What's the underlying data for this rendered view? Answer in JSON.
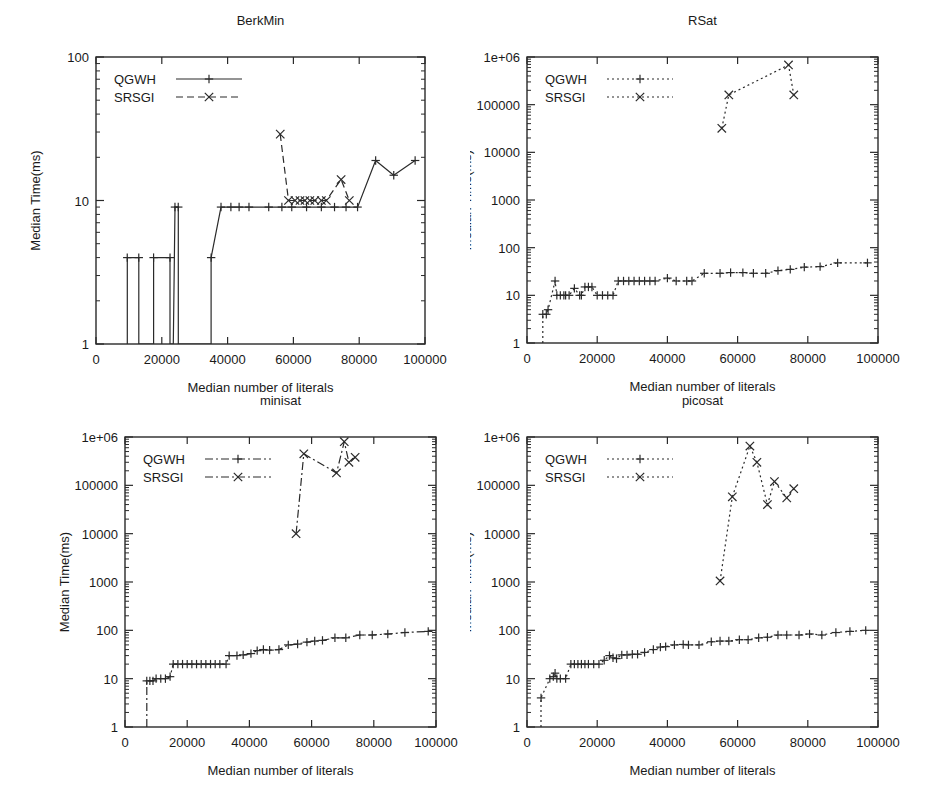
{
  "figure": {
    "xlabel": "Median number of literals",
    "ylabel": "Median  Time(ms)",
    "legend": {
      "series1": "QGWH",
      "series2": "SRSGI"
    },
    "colors": {
      "ink": "#2a2a2a",
      "background": "#ffffff"
    }
  },
  "chart_data": [
    {
      "id": "berkmin",
      "type": "line",
      "title": "BerkMin",
      "xlabel": "Median number of literals",
      "ylabel": "Median  Time(ms)",
      "xlim": [
        0,
        100000
      ],
      "ylim": [
        1,
        100
      ],
      "yscale": "log",
      "grid": false,
      "legend_position": "top-left",
      "xticks": [
        0,
        20000,
        40000,
        60000,
        80000,
        100000
      ],
      "xticklabels": [
        "0",
        "20000",
        "40000",
        "60000",
        "80000",
        "100000"
      ],
      "yticks": [
        1,
        10,
        100
      ],
      "yticklabels": [
        "1",
        "10",
        "100"
      ],
      "series": [
        {
          "name": "QGWH",
          "style": "solid",
          "marker": "plus",
          "points": [
            [
              9500,
              1
            ],
            [
              9500,
              4
            ],
            [
              13000,
              4
            ],
            [
              13000,
              1
            ],
            [
              17500,
              1
            ],
            [
              17500,
              4
            ],
            [
              22500,
              4
            ],
            [
              22500,
              1
            ],
            [
              23500,
              1
            ],
            [
              24000,
              9
            ],
            [
              25000,
              9
            ],
            [
              25000,
              1
            ],
            [
              35000,
              1
            ],
            [
              35000,
              4
            ],
            [
              38000,
              9
            ],
            [
              41000,
              9
            ],
            [
              43500,
              9
            ],
            [
              46500,
              9
            ],
            [
              52500,
              9
            ],
            [
              56500,
              9
            ],
            [
              59500,
              9
            ],
            [
              64000,
              9
            ],
            [
              68500,
              9
            ],
            [
              72500,
              9
            ],
            [
              76000,
              9
            ],
            [
              79500,
              9
            ],
            [
              85000,
              19
            ],
            [
              90500,
              15
            ],
            [
              97000,
              19
            ]
          ]
        },
        {
          "name": "SRSGI",
          "style": "dashed",
          "marker": "cross",
          "points": [
            [
              56000,
              29
            ],
            [
              58500,
              10
            ],
            [
              60500,
              10
            ],
            [
              62000,
              10
            ],
            [
              63500,
              10
            ],
            [
              65000,
              10
            ],
            [
              66500,
              10
            ],
            [
              68500,
              10
            ],
            [
              70000,
              10
            ],
            [
              74500,
              14
            ],
            [
              77000,
              10
            ]
          ]
        }
      ]
    },
    {
      "id": "rsat",
      "type": "line",
      "title": "RSat",
      "xlabel": "Median number of literals",
      "ylabel": "Median  Time(ms)",
      "xlim": [
        0,
        100000
      ],
      "ylim": [
        1,
        1000000
      ],
      "yscale": "log",
      "grid": false,
      "legend_position": "top-left",
      "xticks": [
        0,
        20000,
        40000,
        60000,
        80000,
        100000
      ],
      "xticklabels": [
        "0",
        "20000",
        "40000",
        "60000",
        "80000",
        "100000"
      ],
      "yticks": [
        1,
        10,
        100,
        1000,
        10000,
        100000,
        1000000
      ],
      "yticklabels": [
        "1",
        "10",
        "100",
        "1000",
        "10000",
        "100000",
        "1e+06"
      ],
      "series": [
        {
          "name": "QGWH",
          "style": "dotted",
          "marker": "plus",
          "points": [
            [
              4500,
              1
            ],
            [
              4500,
              4
            ],
            [
              5500,
              4
            ],
            [
              6000,
              5
            ],
            [
              8000,
              20
            ],
            [
              8500,
              10
            ],
            [
              9500,
              10
            ],
            [
              10500,
              10
            ],
            [
              11000,
              10
            ],
            [
              12000,
              10
            ],
            [
              13500,
              14
            ],
            [
              15000,
              10
            ],
            [
              15500,
              10
            ],
            [
              16500,
              15
            ],
            [
              17500,
              15
            ],
            [
              18500,
              15
            ],
            [
              20000,
              10
            ],
            [
              21500,
              10
            ],
            [
              23000,
              10
            ],
            [
              24500,
              10
            ],
            [
              26000,
              20
            ],
            [
              27500,
              20
            ],
            [
              29000,
              20
            ],
            [
              30500,
              20
            ],
            [
              32000,
              20
            ],
            [
              33500,
              20
            ],
            [
              35000,
              20
            ],
            [
              36500,
              20
            ],
            [
              40000,
              23
            ],
            [
              42500,
              20
            ],
            [
              45500,
              20
            ],
            [
              47000,
              20
            ],
            [
              50500,
              29
            ],
            [
              55000,
              29
            ],
            [
              58000,
              30
            ],
            [
              61500,
              30
            ],
            [
              64500,
              29
            ],
            [
              68000,
              29
            ],
            [
              71500,
              33
            ],
            [
              75000,
              35
            ],
            [
              79000,
              39
            ],
            [
              83500,
              40
            ],
            [
              88500,
              48
            ],
            [
              97000,
              48
            ]
          ]
        },
        {
          "name": "SRSGI",
          "style": "dotted",
          "marker": "cross",
          "points": [
            [
              55500,
              32000
            ],
            [
              57500,
              160000
            ],
            [
              74500,
              680000
            ],
            [
              76000,
              160000
            ]
          ]
        }
      ]
    },
    {
      "id": "minisat",
      "type": "line",
      "title": "minisat",
      "xlabel": "Median number of literals",
      "ylabel": "Median  Time(ms)",
      "xlim": [
        0,
        100000
      ],
      "ylim": [
        1,
        1000000
      ],
      "yscale": "log",
      "grid": false,
      "legend_position": "top-left",
      "xticks": [
        0,
        20000,
        40000,
        60000,
        80000,
        100000
      ],
      "xticklabels": [
        "0",
        "20000",
        "40000",
        "60000",
        "80000",
        "100000"
      ],
      "yticks": [
        1,
        10,
        100,
        1000,
        10000,
        100000,
        1000000
      ],
      "yticklabels": [
        "1",
        "10",
        "100",
        "1000",
        "10000",
        "100000",
        "1e+06"
      ],
      "series": [
        {
          "name": "QGWH",
          "style": "dashdot",
          "marker": "plus",
          "points": [
            [
              7000,
              1
            ],
            [
              7000,
              9
            ],
            [
              8000,
              9
            ],
            [
              9000,
              9
            ],
            [
              10000,
              10
            ],
            [
              11500,
              10
            ],
            [
              13000,
              10
            ],
            [
              14500,
              11
            ],
            [
              15500,
              20
            ],
            [
              17000,
              20
            ],
            [
              18500,
              20
            ],
            [
              20000,
              20
            ],
            [
              21500,
              20
            ],
            [
              23000,
              20
            ],
            [
              24500,
              20
            ],
            [
              26000,
              20
            ],
            [
              27500,
              20
            ],
            [
              29000,
              20
            ],
            [
              30500,
              20
            ],
            [
              32500,
              20
            ],
            [
              33500,
              30
            ],
            [
              36000,
              30
            ],
            [
              38000,
              31
            ],
            [
              40500,
              33
            ],
            [
              42500,
              38
            ],
            [
              44500,
              40
            ],
            [
              46500,
              39
            ],
            [
              49500,
              40
            ],
            [
              52500,
              50
            ],
            [
              55500,
              52
            ],
            [
              58500,
              57
            ],
            [
              61000,
              60
            ],
            [
              63500,
              62
            ],
            [
              67500,
              70
            ],
            [
              71000,
              70
            ],
            [
              75500,
              80
            ],
            [
              79500,
              80
            ],
            [
              84500,
              84
            ],
            [
              90000,
              90
            ],
            [
              97500,
              95
            ]
          ]
        },
        {
          "name": "SRSGI",
          "style": "dashdot",
          "marker": "cross",
          "points": [
            [
              55000,
              10000
            ],
            [
              57500,
              450000
            ],
            [
              68000,
              180000
            ],
            [
              70500,
              800000
            ],
            [
              72000,
              300000
            ],
            [
              74000,
              380000
            ]
          ]
        }
      ]
    },
    {
      "id": "picosat",
      "type": "line",
      "title": "picosat",
      "xlabel": "Median number of literals",
      "ylabel": "Median  Time(ms)",
      "xlim": [
        0,
        100000
      ],
      "ylim": [
        1,
        1000000
      ],
      "yscale": "log",
      "grid": false,
      "legend_position": "top-left",
      "xticks": [
        0,
        20000,
        40000,
        60000,
        80000,
        100000
      ],
      "xticklabels": [
        "0",
        "20000",
        "40000",
        "60000",
        "80000",
        "100000"
      ],
      "yticks": [
        1,
        10,
        100,
        1000,
        10000,
        100000,
        1000000
      ],
      "yticklabels": [
        "1",
        "10",
        "100",
        "1000",
        "10000",
        "100000",
        "1e+06"
      ],
      "series": [
        {
          "name": "QGWH",
          "style": "dotted",
          "marker": "plus",
          "points": [
            [
              4000,
              1
            ],
            [
              4000,
              4
            ],
            [
              6500,
              10
            ],
            [
              7500,
              11
            ],
            [
              8000,
              13
            ],
            [
              8500,
              10
            ],
            [
              9500,
              10
            ],
            [
              11000,
              10
            ],
            [
              12500,
              20
            ],
            [
              13500,
              20
            ],
            [
              14500,
              20
            ],
            [
              15500,
              20
            ],
            [
              16500,
              20
            ],
            [
              17500,
              20
            ],
            [
              19000,
              20
            ],
            [
              20500,
              20
            ],
            [
              22000,
              24
            ],
            [
              23500,
              30
            ],
            [
              24500,
              27
            ],
            [
              25500,
              26
            ],
            [
              27000,
              31
            ],
            [
              28500,
              31
            ],
            [
              30000,
              32
            ],
            [
              31500,
              32
            ],
            [
              33500,
              35
            ],
            [
              36000,
              40
            ],
            [
              38000,
              45
            ],
            [
              39500,
              46
            ],
            [
              42000,
              50
            ],
            [
              44500,
              51
            ],
            [
              46000,
              50
            ],
            [
              49000,
              50
            ],
            [
              52500,
              58
            ],
            [
              55000,
              60
            ],
            [
              57500,
              60
            ],
            [
              60500,
              64
            ],
            [
              63000,
              64
            ],
            [
              66000,
              70
            ],
            [
              68500,
              72
            ],
            [
              71500,
              80
            ],
            [
              74000,
              80
            ],
            [
              77500,
              80
            ],
            [
              80500,
              84
            ],
            [
              84000,
              80
            ],
            [
              88000,
              90
            ],
            [
              92000,
              95
            ],
            [
              96500,
              100
            ]
          ]
        },
        {
          "name": "SRSGI",
          "style": "dotted",
          "marker": "cross",
          "points": [
            [
              55000,
              1050
            ],
            [
              58500,
              58000
            ],
            [
              63500,
              650000
            ],
            [
              65500,
              300000
            ],
            [
              68500,
              40000
            ],
            [
              70500,
              120000
            ],
            [
              74000,
              55000
            ],
            [
              76000,
              85000
            ]
          ]
        }
      ]
    }
  ]
}
